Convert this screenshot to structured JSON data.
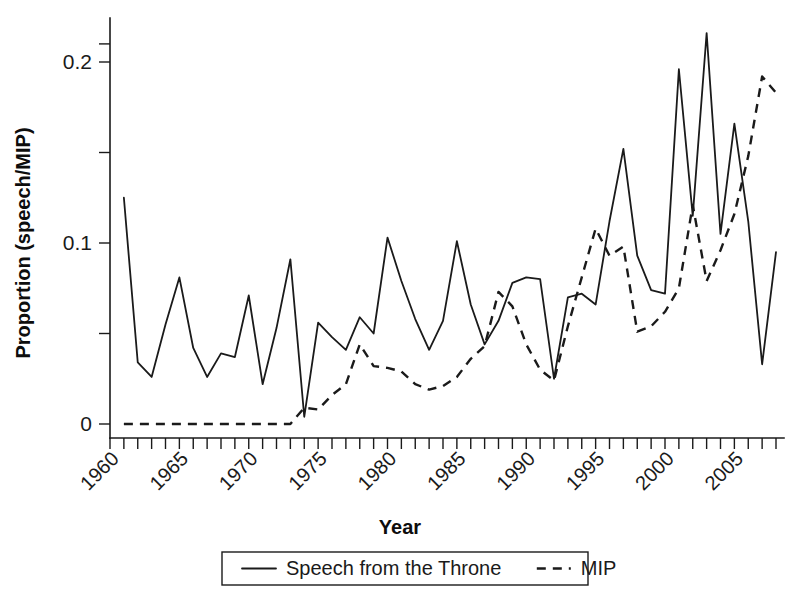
{
  "chart_data": {
    "type": "line",
    "title": "",
    "xlabel": "Year",
    "ylabel": "Proportion (speech/MIP)",
    "xlim": [
      1960,
      2009
    ],
    "ylim": [
      0,
      0.22
    ],
    "grid": false,
    "legend_position": "bottom",
    "y_ticks": [
      0,
      0.05,
      0.1,
      0.15,
      0.2
    ],
    "y_ticklabels": [
      "0",
      "",
      "0.1",
      "",
      "0.2"
    ],
    "x_tick_years": [
      1960,
      1961,
      1962,
      1963,
      1964,
      1965,
      1966,
      1967,
      1968,
      1969,
      1970,
      1971,
      1972,
      1973,
      1974,
      1975,
      1976,
      1977,
      1978,
      1979,
      1980,
      1981,
      1982,
      1983,
      1984,
      1985,
      1986,
      1987,
      1988,
      1989,
      1990,
      1991,
      1992,
      1993,
      1994,
      1995,
      1996,
      1997,
      1998,
      1999,
      2000,
      2001,
      2002,
      2003,
      2004,
      2005,
      2006,
      2007,
      2008
    ],
    "x_ticklabels": [
      "1960",
      "1965",
      "1970",
      "1975",
      "1980",
      "1985",
      "1990",
      "1995",
      "2000",
      "2005"
    ],
    "x_ticklabel_years": [
      1960,
      1965,
      1970,
      1975,
      1980,
      1985,
      1990,
      1995,
      2000,
      2005
    ],
    "series": [
      {
        "name": "Speech from the Throne",
        "style": "solid",
        "color": "#1a1a1a",
        "x": [
          1961,
          1962,
          1963,
          1964,
          1965,
          1966,
          1967,
          1968,
          1969,
          1970,
          1971,
          1972,
          1973,
          1974,
          1975,
          1976,
          1977,
          1978,
          1979,
          1980,
          1981,
          1982,
          1983,
          1984,
          1985,
          1986,
          1987,
          1988,
          1989,
          1990,
          1991,
          1992,
          1993,
          1994,
          1995,
          1996,
          1997,
          1998,
          1999,
          2000,
          2001,
          2002,
          2003,
          2004,
          2005,
          2006,
          2007,
          2008
        ],
        "values": [
          0.125,
          0.034,
          0.026,
          0.055,
          0.081,
          0.042,
          0.026,
          0.039,
          0.037,
          0.071,
          0.022,
          0.053,
          0.091,
          0.004,
          0.056,
          0.048,
          0.041,
          0.059,
          0.05,
          0.103,
          0.079,
          0.058,
          0.041,
          0.057,
          0.101,
          0.066,
          0.044,
          0.057,
          0.078,
          0.081,
          0.08,
          0.025,
          0.07,
          0.072,
          0.066,
          0.112,
          0.152,
          0.093,
          0.074,
          0.072,
          0.196,
          0.115,
          0.216,
          0.105,
          0.166,
          0.112,
          0.033,
          0.095
        ]
      },
      {
        "name": "MIP",
        "style": "dashed",
        "color": "#1a1a1a",
        "x": [
          1961,
          1962,
          1963,
          1964,
          1965,
          1966,
          1967,
          1968,
          1969,
          1970,
          1971,
          1972,
          1973,
          1974,
          1975,
          1976,
          1977,
          1978,
          1979,
          1980,
          1981,
          1982,
          1983,
          1984,
          1985,
          1986,
          1987,
          1988,
          1989,
          1990,
          1991,
          1992,
          1993,
          1994,
          1995,
          1996,
          1997,
          1998,
          1999,
          2000,
          2001,
          2002,
          2003,
          2004,
          2005,
          2006,
          2007,
          2008
        ],
        "values": [
          0.0,
          0.0,
          0.0,
          0.0,
          0.0,
          0.0,
          0.0,
          0.0,
          0.0,
          0.0,
          0.0,
          0.0,
          0.0,
          0.009,
          0.008,
          0.016,
          0.022,
          0.044,
          0.032,
          0.031,
          0.029,
          0.022,
          0.019,
          0.021,
          0.026,
          0.036,
          0.043,
          0.073,
          0.065,
          0.044,
          0.03,
          0.024,
          0.054,
          0.081,
          0.108,
          0.093,
          0.098,
          0.051,
          0.054,
          0.062,
          0.075,
          0.121,
          0.079,
          0.096,
          0.116,
          0.148,
          0.192,
          0.183
        ]
      }
    ]
  },
  "legend": {
    "entries": [
      {
        "label": "Speech from the Throne",
        "style": "solid"
      },
      {
        "label": "MIP",
        "style": "dashed"
      }
    ]
  }
}
